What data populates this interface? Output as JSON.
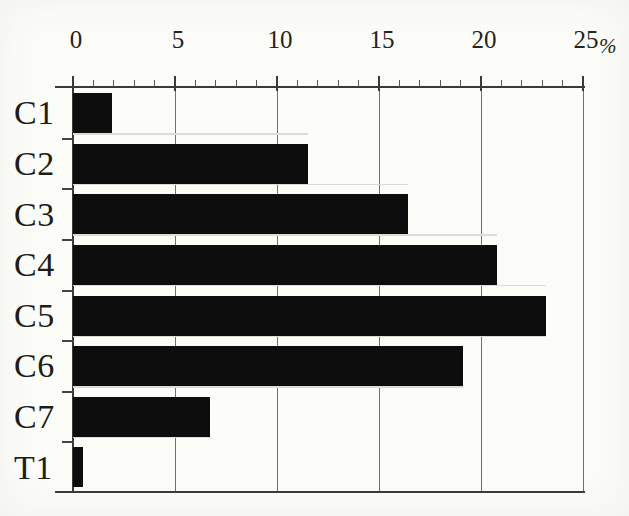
{
  "figure": {
    "unit_symbol": "%"
  },
  "chart_data": {
    "type": "bar",
    "orientation": "horizontal",
    "title": "",
    "xlabel": "%",
    "ylabel": "",
    "xlim": [
      0,
      25
    ],
    "x_major_ticks": [
      0,
      5,
      10,
      15,
      20,
      25
    ],
    "x_minor_tick_step": 1,
    "grid": "vertical gridlines at major ticks, axis on top",
    "legend": "none",
    "categories": [
      "C1",
      "C2",
      "C3",
      "C4",
      "C5",
      "C6",
      "C7",
      "T1"
    ],
    "values": [
      1.9,
      11.5,
      16.4,
      20.8,
      23.2,
      19.1,
      6.7,
      0.5
    ],
    "unit": "%",
    "bar_color": "#0d0d0d",
    "scan_stripe_color": "#dcdcd6",
    "axis_color": "#3a3a3a"
  }
}
